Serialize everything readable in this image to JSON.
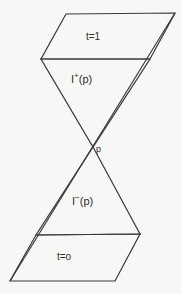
{
  "figure": {
    "name": "light-cone-diagram",
    "background_color": "#f7f7f5",
    "line_color": "#3a3a3a",
    "text_color": "#2e2e2e",
    "width": 181,
    "height": 294
  },
  "labels": {
    "top_slice": "t=1",
    "future_cone_symbol": "I",
    "future_cone_superscript": "+",
    "future_cone_argument": "(p)",
    "point": "p",
    "past_cone_symbol": "I",
    "past_cone_superscript": "−",
    "past_cone_argument": "(p)",
    "bottom_slice": "t=o"
  },
  "geometry": {
    "top_parallelogram": {
      "name": "top-time-slice",
      "points": "66,14 175,13 150,59 41,59"
    },
    "bottom_parallelogram": {
      "name": "bottom-time-slice",
      "points": "36,235 140,234 115,281 10,281"
    },
    "future_cone_triangle": {
      "name": "future-light-cone",
      "points": "41,59 150,59 93,147"
    },
    "past_cone_triangle": {
      "name": "past-light-cone",
      "points": "93,147 140,234 36,235"
    },
    "long_diagonal": {
      "name": "right-null-ray",
      "x1": 175,
      "y1": 13,
      "x2": 10,
      "y2": 281
    },
    "left_short_diagonal": {
      "name": "left-upper-null-ray",
      "x1": 66,
      "y1": 14,
      "x2": 41,
      "y2": 59
    },
    "lower_right_diagonal": {
      "name": "right-lower-null-ray",
      "x1": 140,
      "y1": 234,
      "x2": 115,
      "y2": 281
    },
    "vertex": {
      "name": "cone-vertex-point",
      "x": 93,
      "y": 147
    }
  }
}
